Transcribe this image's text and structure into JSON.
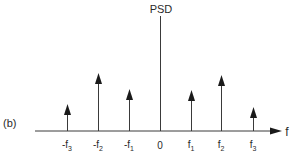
{
  "figure": {
    "panel_label": "(b)",
    "y_axis_label": "PSD",
    "x_axis_label": "f",
    "origin_label": "0"
  },
  "impulses": [
    {
      "label": "-f",
      "sub": "3",
      "x": 67,
      "top": 104
    },
    {
      "label": "-f",
      "sub": "2",
      "x": 98,
      "top": 73
    },
    {
      "label": "-f",
      "sub": "1",
      "x": 129,
      "top": 89
    },
    {
      "label": "f",
      "sub": "1",
      "x": 191,
      "top": 90
    },
    {
      "label": "f",
      "sub": "2",
      "x": 221,
      "top": 75
    },
    {
      "label": "f",
      "sub": "3",
      "x": 253,
      "top": 107
    }
  ],
  "colors": {
    "line": "#3a3a3a",
    "text": "#2a2a2a",
    "background": "#ffffff"
  }
}
